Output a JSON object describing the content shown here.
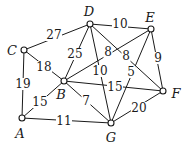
{
  "diagram": {
    "type": "weighted-undirected-graph",
    "nodes": [
      {
        "id": "A",
        "label": "A",
        "x": 22,
        "y": 118,
        "lx": 20,
        "ly": 133
      },
      {
        "id": "B",
        "label": "B",
        "x": 64,
        "y": 81,
        "lx": 61,
        "ly": 94
      },
      {
        "id": "C",
        "label": "C",
        "x": 24,
        "y": 50,
        "lx": 12,
        "ly": 50
      },
      {
        "id": "D",
        "label": "D",
        "x": 90,
        "y": 24,
        "lx": 89,
        "ly": 11
      },
      {
        "id": "E",
        "label": "E",
        "x": 151,
        "y": 29,
        "lx": 150,
        "ly": 17
      },
      {
        "id": "F",
        "label": "F",
        "x": 163,
        "y": 91,
        "lx": 176,
        "ly": 93
      },
      {
        "id": "G",
        "label": "G",
        "x": 111,
        "y": 123,
        "lx": 111,
        "ly": 137
      }
    ],
    "edges": [
      {
        "from": "C",
        "to": "D",
        "weight": "27",
        "lx": 54,
        "ly": 35
      },
      {
        "from": "D",
        "to": "E",
        "weight": "10",
        "lx": 120,
        "ly": 24
      },
      {
        "from": "C",
        "to": "B",
        "weight": "18",
        "lx": 44,
        "ly": 67
      },
      {
        "from": "D",
        "to": "B",
        "weight": "25",
        "lx": 75,
        "ly": 54
      },
      {
        "from": "D",
        "to": "G",
        "weight": "10",
        "lx": 100,
        "ly": 71
      },
      {
        "from": "D",
        "to": "F",
        "weight": "8",
        "lx": 126,
        "ly": 56
      },
      {
        "from": "E",
        "to": "B",
        "weight": "8",
        "lx": 108,
        "ly": 52
      },
      {
        "from": "E",
        "to": "G",
        "weight": "5",
        "lx": 131,
        "ly": 72
      },
      {
        "from": "E",
        "to": "F",
        "weight": "9",
        "lx": 158,
        "ly": 58
      },
      {
        "from": "C",
        "to": "A",
        "weight": "19",
        "lx": 23,
        "ly": 84
      },
      {
        "from": "A",
        "to": "B",
        "weight": "15",
        "lx": 40,
        "ly": 102
      },
      {
        "from": "B",
        "to": "G",
        "weight": "7",
        "lx": 86,
        "ly": 101
      },
      {
        "from": "B",
        "to": "F",
        "weight": "15",
        "lx": 115,
        "ly": 87
      },
      {
        "from": "G",
        "to": "F",
        "weight": "20",
        "lx": 139,
        "ly": 108
      },
      {
        "from": "A",
        "to": "G",
        "weight": "11",
        "lx": 64,
        "ly": 121
      }
    ]
  }
}
